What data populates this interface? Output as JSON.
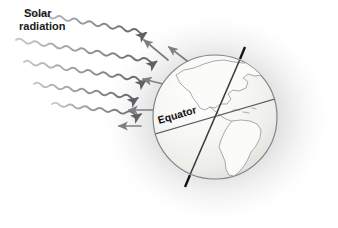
{
  "figure": {
    "background_color": "#ffffff"
  },
  "labels": {
    "solar_radiation_line1": "Solar",
    "solar_radiation_line2": "radiation",
    "equator": "Equator"
  },
  "colors": {
    "ray_dark": "#6e7073",
    "ray_light": "#b9bbbe",
    "globe_fill": "#f3f3f1",
    "globe_outline": "#808286",
    "land_outline": "#9a9c9b",
    "land_fill": "#fbfbf9",
    "axis": "#3a3a3a",
    "pole_tip": "#111111",
    "shadow": "#8e9092",
    "text": "#1a1a1a"
  },
  "diagram": {
    "globe": {
      "center_x": 215,
      "center_y": 117,
      "radius": 63
    },
    "axis": {
      "tilt_degrees": 23.5,
      "north_pole_x": 241,
      "north_pole_y": 54,
      "south_pole_x": 189,
      "south_pole_y": 180
    },
    "equator_line": {
      "x1": 154,
      "y1": 135,
      "x2": 276,
      "y2": 99
    },
    "incoming_rays": [
      {
        "x1": 26,
        "y1": 12,
        "x2": 150,
        "y2": 46,
        "style": "wavy"
      },
      {
        "x1": 16,
        "y1": 40,
        "x2": 160,
        "y2": 80,
        "style": "wavy"
      },
      {
        "x1": 24,
        "y1": 62,
        "x2": 157,
        "y2": 99,
        "style": "wavy"
      },
      {
        "x1": 34,
        "y1": 84,
        "x2": 152,
        "y2": 115,
        "style": "wavy"
      },
      {
        "x1": 52,
        "y1": 104,
        "x2": 143,
        "y2": 124,
        "style": "wavy"
      }
    ],
    "reflected_arrows": [
      {
        "x1": 168,
        "y1": 60,
        "x2": 143,
        "y2": 39,
        "style": "straight"
      },
      {
        "x1": 190,
        "y1": 64,
        "x2": 168,
        "y2": 46,
        "style": "straight"
      },
      {
        "x1": 167,
        "y1": 85,
        "x2": 142,
        "y2": 78,
        "style": "straight"
      },
      {
        "x1": 152,
        "y1": 110,
        "x2": 128,
        "y2": 110,
        "style": "straight"
      },
      {
        "x1": 140,
        "y1": 126,
        "x2": 118,
        "y2": 126,
        "style": "straight"
      }
    ],
    "ray_count_incoming": 5,
    "ray_count_reflected": 5,
    "continents_shown": [
      "North America",
      "South America"
    ]
  }
}
